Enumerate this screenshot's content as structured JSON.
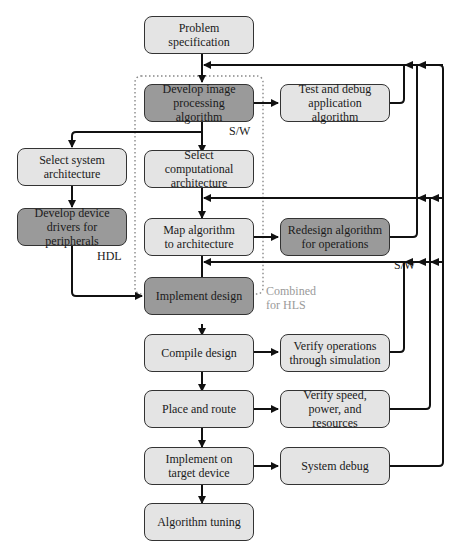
{
  "diagram": {
    "nodes": {
      "problem_spec": {
        "label": "Problem\nspecification",
        "style": "light"
      },
      "develop_image": {
        "label": "Develop image\nprocessing algorithm",
        "style": "dark"
      },
      "test_debug": {
        "label": "Test and debug\napplication algorithm",
        "style": "light"
      },
      "select_system": {
        "label": "Select system\narchitecture",
        "style": "light"
      },
      "select_comp": {
        "label": "Select computational\narchitecture",
        "style": "light"
      },
      "develop_drivers": {
        "label": "Develop device\ndrivers for peripherals",
        "style": "dark"
      },
      "map_algorithm": {
        "label": "Map algorithm\nto architecture",
        "style": "light"
      },
      "redesign": {
        "label": "Redesign algorithm\nfor operations",
        "style": "dark"
      },
      "implement_design": {
        "label": "Implement design",
        "style": "dark"
      },
      "compile": {
        "label": "Compile design",
        "style": "light"
      },
      "verify_ops": {
        "label": "Verify operations\nthrough simulation",
        "style": "light"
      },
      "place_route": {
        "label": "Place and route",
        "style": "light"
      },
      "verify_speed": {
        "label": "Verify speed,\npower, and resources",
        "style": "light"
      },
      "implement_target": {
        "label": "Implement on\ntarget device",
        "style": "light"
      },
      "system_debug": {
        "label": "System debug",
        "style": "light"
      },
      "algorithm_tuning": {
        "label": "Algorithm tuning",
        "style": "light"
      }
    },
    "annotations": {
      "sw_1": "S/W",
      "sw_2": "S/W",
      "hdl": "HDL",
      "combined_line1": "Combined",
      "combined_line2": "for HLS"
    },
    "colors": {
      "light_box": "#e4e4e4",
      "dark_box": "#9a9a9a",
      "line": "#111111",
      "hls_group": "#9a9a9a"
    }
  }
}
